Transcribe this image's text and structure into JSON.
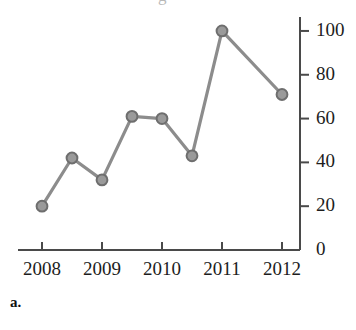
{
  "figure": {
    "panel_label": "a.",
    "title_remnant": "g",
    "accent_color": "#8c8c8c",
    "marker_fill": "#9a9a9a",
    "marker_stroke": "#6e6e6e",
    "axis_color": "#4a4a4a",
    "text_color": "#1d1d1d"
  },
  "chart_data": {
    "type": "line",
    "title": "",
    "xlabel": "",
    "ylabel": "",
    "x": [
      2008,
      2008.5,
      2009,
      2009.5,
      2010,
      2010.5,
      2011,
      2012
    ],
    "values": [
      20,
      42,
      32,
      61,
      60,
      43,
      100,
      71
    ],
    "xtick_labels": [
      "2008",
      "2009",
      "2010",
      "2011",
      "2012"
    ],
    "xtick_values": [
      2008,
      2009,
      2010,
      2011,
      2012
    ],
    "ytick_labels": [
      "0",
      "20",
      "40",
      "60",
      "80",
      "100"
    ],
    "ytick_values": [
      0,
      20,
      40,
      60,
      80,
      100
    ],
    "xlim": [
      2007.6,
      2012.3
    ],
    "ylim": [
      0,
      105
    ],
    "grid": false,
    "legend": "none",
    "yaxis_position": "right",
    "marker": "circle",
    "series": [
      {
        "name": "series-1",
        "values": [
          20,
          42,
          32,
          61,
          60,
          43,
          100,
          71
        ]
      }
    ]
  }
}
